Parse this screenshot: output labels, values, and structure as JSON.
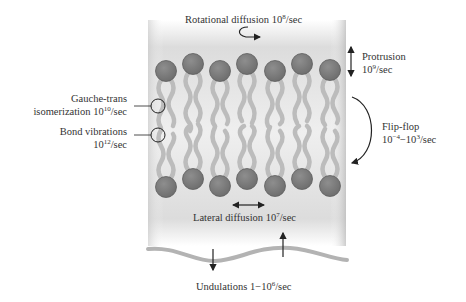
{
  "diagram": {
    "colors": {
      "membrane_band": "#d9d9d9",
      "head_group": "#7f7f7f",
      "head_stroke": "#5e5e5e",
      "tail": "#b8b8b8",
      "arrow": "#222222",
      "undulation": "#b3b3b3"
    },
    "labels": {
      "rotational": {
        "text": "Rotational diffusion 10",
        "exp": "8",
        "unit": "/sec"
      },
      "protrusion": {
        "line1": "Protrusion",
        "line2_base": "10",
        "exp": "9",
        "unit": "/sec"
      },
      "flipflop": {
        "line1": "Flip-flop",
        "line2_base": "10",
        "exp1": "−4",
        "mid": "−10",
        "exp2": "3",
        "unit": "/sec"
      },
      "gauche": {
        "line1": "Gauche-trans",
        "line2_base": "isomerization 10",
        "exp": "10",
        "unit": "/sec"
      },
      "bond": {
        "line1": "Bond vibrations",
        "line2_base": "10",
        "exp": "12",
        "unit": "/sec"
      },
      "lateral": {
        "text": "Lateral diffusion 10",
        "exp": "7",
        "unit": "/sec"
      },
      "undulations": {
        "text": "Undulations 1−10",
        "exp": "6",
        "unit": "/sec"
      }
    },
    "top_heads": [
      {
        "x": 166,
        "y": 71
      },
      {
        "x": 193,
        "y": 64
      },
      {
        "x": 220,
        "y": 71
      },
      {
        "x": 247,
        "y": 64
      },
      {
        "x": 275,
        "y": 71
      },
      {
        "x": 302,
        "y": 64
      },
      {
        "x": 330,
        "y": 70
      }
    ],
    "bottom_heads": [
      {
        "x": 166,
        "y": 187
      },
      {
        "x": 193,
        "y": 179
      },
      {
        "x": 220,
        "y": 186
      },
      {
        "x": 247,
        "y": 179
      },
      {
        "x": 275,
        "y": 186
      },
      {
        "x": 302,
        "y": 179
      },
      {
        "x": 330,
        "y": 186
      }
    ]
  }
}
